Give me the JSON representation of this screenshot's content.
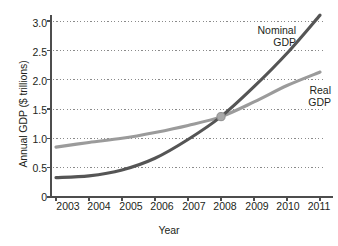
{
  "chart_data": {
    "type": "line",
    "title": "",
    "xlabel": "Year",
    "ylabel": "Annual GDP ($ trillions)",
    "x": [
      2003,
      2004,
      2005,
      2006,
      2007,
      2008,
      2009,
      2010,
      2011
    ],
    "xtick_labels": [
      "2003",
      "2004",
      "2005",
      "2006",
      "2007",
      "2008",
      "2009",
      "2010",
      "2011"
    ],
    "ytick_labels": [
      "0",
      "0.5",
      "1.0",
      "1.5",
      "2.0",
      "2.5",
      "3.0"
    ],
    "ytick_values": [
      0,
      0.5,
      1.0,
      1.5,
      2.0,
      2.5,
      3.0
    ],
    "xlim": [
      2002.85,
      2011.15
    ],
    "ylim": [
      0,
      3.2
    ],
    "grid": "horizontal-dotted",
    "legend": "inline-annotations",
    "series": [
      {
        "name": "Nominal GDP",
        "label_line1": "Nominal",
        "label_line2": "GDP",
        "color": "#555555",
        "values": [
          0.33,
          0.36,
          0.46,
          0.66,
          0.98,
          1.37,
          1.88,
          2.45,
          3.1
        ]
      },
      {
        "name": "Real GDP",
        "label_line1": "Real",
        "label_line2": "GDP",
        "color": "#9b9b9b",
        "values": [
          0.85,
          0.93,
          1.0,
          1.1,
          1.22,
          1.37,
          1.62,
          1.9,
          2.13
        ]
      }
    ],
    "intersection": {
      "x": 2008,
      "y": 1.37,
      "marker": "circle"
    }
  },
  "axis": {
    "axis_color": "#4d4d4d",
    "grid_color": "#8a8a8a"
  }
}
